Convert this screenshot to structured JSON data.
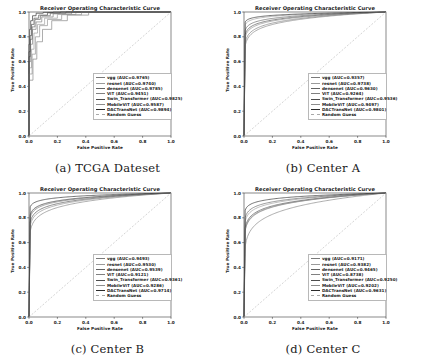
{
  "figure": {
    "panel_title": "Receiver Operating Characteristic Curve",
    "xlabel": "False Positive Rate",
    "ylabel": "True Positive Rate",
    "xticks": [
      "0.0",
      "0.2",
      "0.4",
      "0.6",
      "0.8",
      "1.0"
    ],
    "yticks": [
      "0.0",
      "0.2",
      "0.4",
      "0.6",
      "0.8",
      "1.0"
    ],
    "captions": {
      "a": "(a) TCGA Dateset",
      "b": "(b) Center A",
      "c": "(c) Center B",
      "d": "(d) Center C"
    },
    "colors": {
      "vgg": "#7a7a7a",
      "resnet": "#9a9a9a",
      "densenet": "#636363",
      "vit": "#808080",
      "swin": "#4d4d4d",
      "mobilevit": "#8d8d8d",
      "dactransnet": "#2b2b2b",
      "random_guess": "#a9a9a9",
      "axis": "#3a3a3a",
      "background": "#ffffff"
    }
  },
  "chart_data": [
    {
      "type": "line",
      "panel": "a",
      "caption": "(a) TCGA Dateset",
      "title": "Receiver Operating Characteristic Curve",
      "xlabel": "False Positive Rate",
      "ylabel": "True Positive Rate",
      "xlim": [
        0.0,
        1.0
      ],
      "ylim": [
        0.0,
        1.0
      ],
      "grid": false,
      "legend_position": "lower right",
      "style": "stepped",
      "series": [
        {
          "name": "vgg",
          "auc": 0.9765,
          "label": "vgg (AUC=0.9765)",
          "x": [
            0.0,
            0.0,
            0.012,
            0.012,
            0.025,
            0.025,
            0.05,
            0.05,
            0.09,
            0.09,
            0.17,
            0.17,
            0.3,
            0.3,
            1.0
          ],
          "y": [
            0.0,
            0.6,
            0.6,
            0.74,
            0.74,
            0.86,
            0.86,
            0.92,
            0.92,
            0.96,
            0.96,
            0.985,
            0.985,
            1.0,
            1.0
          ]
        },
        {
          "name": "resnet",
          "auc": 0.974,
          "label": "resnet (AUC=0.9740)",
          "x": [
            0.0,
            0.0,
            0.018,
            0.018,
            0.035,
            0.035,
            0.06,
            0.06,
            0.11,
            0.11,
            0.2,
            0.2,
            0.33,
            0.33,
            1.0
          ],
          "y": [
            0.0,
            0.55,
            0.55,
            0.7,
            0.7,
            0.83,
            0.83,
            0.9,
            0.9,
            0.95,
            0.95,
            0.98,
            0.98,
            1.0,
            1.0
          ]
        },
        {
          "name": "densenet",
          "auc": 0.9785,
          "label": "densenet (AUC=0.9785)",
          "x": [
            0.0,
            0.0,
            0.01,
            0.01,
            0.022,
            0.022,
            0.042,
            0.042,
            0.08,
            0.08,
            0.15,
            0.15,
            0.26,
            0.26,
            1.0
          ],
          "y": [
            0.0,
            0.64,
            0.64,
            0.78,
            0.78,
            0.88,
            0.88,
            0.94,
            0.94,
            0.97,
            0.97,
            0.99,
            0.99,
            1.0,
            1.0
          ]
        },
        {
          "name": "ViT",
          "auc": 0.9451,
          "label": "ViT (AUC=0.9451)",
          "x": [
            0.0,
            0.0,
            0.028,
            0.028,
            0.055,
            0.055,
            0.095,
            0.095,
            0.16,
            0.16,
            0.27,
            0.27,
            0.42,
            0.42,
            1.0
          ],
          "y": [
            0.0,
            0.45,
            0.45,
            0.62,
            0.62,
            0.76,
            0.76,
            0.86,
            0.86,
            0.93,
            0.93,
            0.975,
            0.975,
            1.0,
            1.0
          ]
        },
        {
          "name": "Swin_Transformer",
          "auc": 0.9825,
          "label": "Swin_Transformer (AUC=0.9825)",
          "x": [
            0.0,
            0.0,
            0.008,
            0.008,
            0.018,
            0.018,
            0.035,
            0.035,
            0.068,
            0.068,
            0.13,
            0.13,
            0.22,
            0.22,
            1.0
          ],
          "y": [
            0.0,
            0.68,
            0.68,
            0.81,
            0.81,
            0.9,
            0.9,
            0.95,
            0.95,
            0.975,
            0.975,
            0.993,
            0.993,
            1.0,
            1.0
          ]
        },
        {
          "name": "MobileViT",
          "auc": 0.9587,
          "label": "MobileViT (AUC=0.9587)",
          "x": [
            0.0,
            0.0,
            0.022,
            0.022,
            0.045,
            0.045,
            0.075,
            0.075,
            0.13,
            0.13,
            0.23,
            0.23,
            0.37,
            0.37,
            1.0
          ],
          "y": [
            0.0,
            0.5,
            0.5,
            0.66,
            0.66,
            0.8,
            0.8,
            0.89,
            0.89,
            0.94,
            0.94,
            0.978,
            0.978,
            1.0,
            1.0
          ]
        },
        {
          "name": "DACTransNet",
          "auc": 0.9894,
          "label": "DACTransNet (AUC=0.9894)",
          "x": [
            0.0,
            0.0,
            0.005,
            0.005,
            0.012,
            0.012,
            0.025,
            0.025,
            0.05,
            0.05,
            0.1,
            0.1,
            0.17,
            0.17,
            1.0
          ],
          "y": [
            0.0,
            0.74,
            0.74,
            0.86,
            0.86,
            0.93,
            0.93,
            0.97,
            0.97,
            0.99,
            0.99,
            0.997,
            0.997,
            1.0,
            1.0
          ]
        },
        {
          "name": "Random Guess",
          "auc": 0.5,
          "label": "Random Guess",
          "x": [
            0.0,
            1.0
          ],
          "y": [
            0.0,
            1.0
          ],
          "dashed": true
        }
      ]
    },
    {
      "type": "line",
      "panel": "b",
      "caption": "(b) Center A",
      "title": "Receiver Operating Characteristic Curve",
      "xlabel": "False Positive Rate",
      "ylabel": "True Positive Rate",
      "xlim": [
        0.0,
        1.0
      ],
      "ylim": [
        0.0,
        1.0
      ],
      "grid": false,
      "legend_position": "lower right",
      "style": "smooth",
      "series": [
        {
          "name": "vgg",
          "auc": 0.9357,
          "label": "vgg (AUC=0.9357)",
          "shape_k": 0.055
        },
        {
          "name": "resnet",
          "auc": 0.9738,
          "label": "resnet (AUC=0.9738)",
          "shape_k": 0.022
        },
        {
          "name": "densenet",
          "auc": 0.963,
          "label": "densenet (AUC=0.9630)",
          "shape_k": 0.032
        },
        {
          "name": "ViT",
          "auc": 0.9264,
          "label": "ViT (AUC=0.9264)",
          "shape_k": 0.062
        },
        {
          "name": "Swin_Transformer",
          "auc": 0.9536,
          "label": "Swin_Transformer (AUC=0.9536)",
          "shape_k": 0.04
        },
        {
          "name": "MobileViT",
          "auc": 0.9497,
          "label": "MobileViT (AUC=0.9497)",
          "shape_k": 0.045
        },
        {
          "name": "DACTransNet",
          "auc": 0.9801,
          "label": "DACTransNet (AUC=0.9801)",
          "shape_k": 0.017
        },
        {
          "name": "Random Guess",
          "auc": 0.5,
          "label": "Random Guess",
          "dashed": true
        }
      ]
    },
    {
      "type": "line",
      "panel": "c",
      "caption": "(c) Center B",
      "title": "Receiver Operating Characteristic Curve",
      "xlabel": "False Positive Rate",
      "ylabel": "True Positive Rate",
      "xlim": [
        0.0,
        1.0
      ],
      "ylim": [
        0.0,
        1.0
      ],
      "grid": false,
      "legend_position": "lower right",
      "style": "smooth",
      "series": [
        {
          "name": "vgg",
          "auc": 0.9493,
          "label": "vgg (AUC=0.9493)",
          "shape_k": 0.044
        },
        {
          "name": "resnet",
          "auc": 0.953,
          "label": "resnet (AUC=0.9530)",
          "shape_k": 0.04
        },
        {
          "name": "densenet",
          "auc": 0.9539,
          "label": "densenet (AUC=0.9539)",
          "shape_k": 0.039
        },
        {
          "name": "ViT",
          "auc": 0.9121,
          "label": "ViT (AUC=0.9121)",
          "shape_k": 0.072
        },
        {
          "name": "Swin_Transformer",
          "auc": 0.9361,
          "label": "Swin_Transformer (AUC=0.9361)",
          "shape_k": 0.053
        },
        {
          "name": "MobileViT",
          "auc": 0.9286,
          "label": "MobileViT (AUC=0.9286)",
          "shape_k": 0.06
        },
        {
          "name": "DACTransNet",
          "auc": 0.9714,
          "label": "DACTransNet (AUC=0.9714)",
          "shape_k": 0.024
        },
        {
          "name": "Random Guess",
          "auc": 0.5,
          "label": "Random Guess",
          "dashed": true
        }
      ]
    },
    {
      "type": "line",
      "panel": "d",
      "caption": "(d) Center C",
      "title": "Receiver Operating Characteristic Curve",
      "xlabel": "False Positive Rate",
      "ylabel": "True Positive Rate",
      "xlim": [
        0.0,
        1.0
      ],
      "ylim": [
        0.0,
        1.0
      ],
      "grid": false,
      "legend_position": "lower right",
      "style": "smooth",
      "series": [
        {
          "name": "vgg",
          "auc": 0.9171,
          "label": "vgg (AUC=0.9171)",
          "shape_k": 0.07
        },
        {
          "name": "resnet",
          "auc": 0.9382,
          "label": "resnet (AUC=0.9382)",
          "shape_k": 0.051
        },
        {
          "name": "densenet",
          "auc": 0.9465,
          "label": "densenet (AUC=0.9465)",
          "shape_k": 0.044
        },
        {
          "name": "ViT",
          "auc": 0.8738,
          "label": "ViT (AUC=0.8738)",
          "shape_k": 0.105
        },
        {
          "name": "Swin_Transformer",
          "auc": 0.925,
          "label": "Swin_Transformer (AUC=0.9250)",
          "shape_k": 0.064
        },
        {
          "name": "MobileViT",
          "auc": 0.9202,
          "label": "MobileViT (AUC=0.9202)",
          "shape_k": 0.068
        },
        {
          "name": "DACTransNet",
          "auc": 0.9631,
          "label": "DACTransNet (AUC=0.9631)",
          "shape_k": 0.03
        },
        {
          "name": "Random Guess",
          "auc": 0.5,
          "label": "Random Guess",
          "dashed": true
        }
      ]
    }
  ]
}
